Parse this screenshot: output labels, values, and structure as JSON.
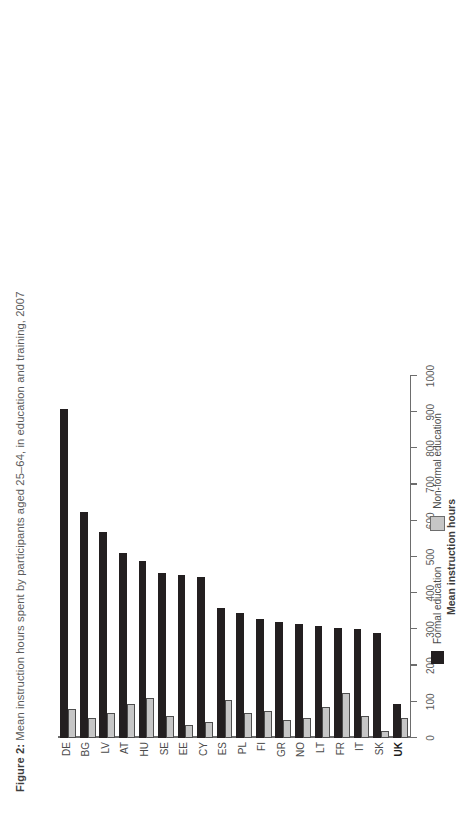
{
  "figure": {
    "label": "Figure 2:",
    "caption": " Mean instruction hours spent by participants aged 25–64, in education and training, 2007"
  },
  "colors": {
    "formal": "#231f20",
    "nonformal": "#c6c6c6",
    "axis": "#6d6d6d",
    "text": "#4b4b4b",
    "background": "#ffffff"
  },
  "legend": {
    "position": "below-plot",
    "items": [
      {
        "label": "Formal education",
        "swatch": "formal"
      },
      {
        "label": "Non-formal education",
        "swatch": "nonformal"
      }
    ]
  },
  "axes": {
    "value_axis_title": "Mean instruction hours",
    "value_ticks": [
      "0",
      "100",
      "200",
      "300",
      "400",
      "500",
      "600",
      "700",
      "800",
      "900",
      "1000"
    ],
    "value_min": 0,
    "value_max": 1000,
    "grid": false,
    "highlighted_category": "UK"
  },
  "chart_data": {
    "type": "bar",
    "orientation": "horizontal-grouped",
    "title": "Mean instruction hours spent by participants aged 25–64, in education and training, 2007",
    "xlabel": "Mean instruction hours",
    "ylabel": "",
    "ylim": [
      0,
      1000
    ],
    "categories": [
      "DE",
      "BG",
      "LV",
      "AT",
      "HU",
      "SE",
      "EE",
      "CY",
      "ES",
      "PL",
      "FI",
      "GR",
      "NO",
      "LT",
      "FR",
      "IT",
      "SK",
      "UK"
    ],
    "series": [
      {
        "name": "Formal education",
        "color": "#231f20",
        "values": [
          910,
          625,
          570,
          510,
          490,
          455,
          450,
          445,
          360,
          345,
          330,
          320,
          315,
          310,
          305,
          300,
          290,
          95
        ]
      },
      {
        "name": "Non-formal education",
        "color": "#c6c6c6",
        "values": [
          80,
          55,
          70,
          95,
          110,
          60,
          35,
          45,
          105,
          70,
          75,
          50,
          55,
          85,
          125,
          60,
          20,
          55
        ]
      }
    ]
  }
}
